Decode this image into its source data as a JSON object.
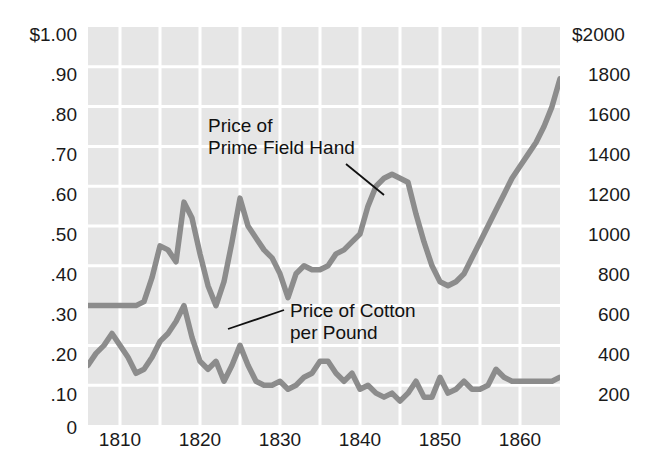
{
  "figure": {
    "title": "",
    "background_color": "#ffffff",
    "plot_background_color": "#e6e6e6",
    "gridline_color": "#ffffff",
    "line_color": "#8c8c8c",
    "text_color": "#111111"
  },
  "axes": {
    "left": {
      "label": "",
      "ticks": [
        "$1.00",
        ".90",
        ".80",
        ".70",
        ".60",
        ".50",
        ".40",
        ".30",
        ".20",
        ".10",
        "0"
      ],
      "values": [
        1.0,
        0.9,
        0.8,
        0.7,
        0.6,
        0.5,
        0.4,
        0.3,
        0.2,
        0.1,
        0.0
      ],
      "range": [
        0,
        1.0
      ]
    },
    "right": {
      "label": "",
      "ticks": [
        "$2000",
        "1800",
        "1600",
        "1400",
        "1200",
        "1000",
        "800",
        "600",
        "400",
        "200",
        ""
      ],
      "values": [
        2000,
        1800,
        1600,
        1400,
        1200,
        1000,
        800,
        600,
        400,
        200,
        0
      ],
      "range": [
        0,
        2000
      ]
    },
    "bottom": {
      "label": "",
      "ticks": [
        "1810",
        "1820",
        "1830",
        "1840",
        "1850",
        "1860"
      ],
      "values": [
        1810,
        1820,
        1830,
        1840,
        1850,
        1860
      ],
      "range": [
        1806,
        1865
      ],
      "minor_tick_step": 5
    }
  },
  "annotations": [
    {
      "id": "slave-price-label",
      "line1": "Price of",
      "line2": "Prime Field Hand"
    },
    {
      "id": "cotton-price-label",
      "line1": "Price of Cotton",
      "line2": "per Pound"
    }
  ],
  "chart_data": {
    "type": "line",
    "title": "",
    "xlabel": "",
    "ylabel": "",
    "xlim": [
      1806,
      1865
    ],
    "ylim": [
      0,
      1.0
    ],
    "y2lim": [
      0,
      2000
    ],
    "grid": true,
    "legend": "annotations-inline",
    "x": [
      1806,
      1807,
      1808,
      1809,
      1810,
      1811,
      1812,
      1813,
      1814,
      1815,
      1816,
      1817,
      1818,
      1819,
      1820,
      1821,
      1822,
      1823,
      1824,
      1825,
      1826,
      1827,
      1828,
      1829,
      1830,
      1831,
      1832,
      1833,
      1834,
      1835,
      1836,
      1837,
      1838,
      1839,
      1840,
      1841,
      1842,
      1843,
      1844,
      1845,
      1846,
      1847,
      1848,
      1849,
      1850,
      1851,
      1852,
      1853,
      1854,
      1855,
      1856,
      1857,
      1858,
      1859,
      1860,
      1861,
      1862,
      1863,
      1864,
      1865
    ],
    "series": [
      {
        "name": "Price of Prime Field Hand",
        "axis": "right",
        "unit": "dollars",
        "values_left_scale": [
          0.3,
          0.3,
          0.3,
          0.3,
          0.3,
          0.3,
          0.3,
          0.31,
          0.37,
          0.45,
          0.44,
          0.41,
          0.56,
          0.52,
          0.43,
          0.35,
          0.3,
          0.36,
          0.46,
          0.57,
          0.5,
          0.47,
          0.44,
          0.42,
          0.38,
          0.32,
          0.38,
          0.4,
          0.39,
          0.39,
          0.4,
          0.43,
          0.44,
          0.46,
          0.48,
          0.55,
          0.6,
          0.62,
          0.63,
          0.62,
          0.61,
          0.53,
          0.46,
          0.4,
          0.36,
          0.35,
          0.36,
          0.38,
          0.42,
          0.46,
          0.5,
          0.54,
          0.58,
          0.62,
          0.65,
          0.68,
          0.71,
          0.75,
          0.8,
          0.87
        ],
        "values_dollars": [
          600,
          600,
          600,
          600,
          600,
          600,
          600,
          620,
          740,
          900,
          880,
          820,
          1120,
          1040,
          860,
          700,
          600,
          720,
          920,
          1140,
          1000,
          940,
          880,
          840,
          760,
          640,
          760,
          800,
          780,
          780,
          800,
          860,
          880,
          920,
          960,
          1100,
          1200,
          1240,
          1260,
          1240,
          1220,
          1060,
          920,
          800,
          720,
          700,
          720,
          760,
          840,
          920,
          1000,
          1080,
          1160,
          1240,
          1300,
          1360,
          1420,
          1500,
          1600,
          1740
        ]
      },
      {
        "name": "Price of Cotton per Pound",
        "axis": "left",
        "unit": "dollars per pound",
        "values": [
          0.15,
          0.18,
          0.2,
          0.23,
          0.2,
          0.17,
          0.13,
          0.14,
          0.17,
          0.21,
          0.23,
          0.26,
          0.3,
          0.22,
          0.16,
          0.14,
          0.16,
          0.11,
          0.15,
          0.2,
          0.15,
          0.11,
          0.1,
          0.1,
          0.11,
          0.09,
          0.1,
          0.12,
          0.13,
          0.16,
          0.16,
          0.13,
          0.11,
          0.13,
          0.09,
          0.1,
          0.08,
          0.07,
          0.08,
          0.06,
          0.08,
          0.11,
          0.07,
          0.07,
          0.12,
          0.08,
          0.09,
          0.11,
          0.09,
          0.09,
          0.1,
          0.14,
          0.12,
          0.11,
          0.11,
          0.11,
          0.11,
          0.11,
          0.11,
          0.12
        ]
      }
    ]
  }
}
